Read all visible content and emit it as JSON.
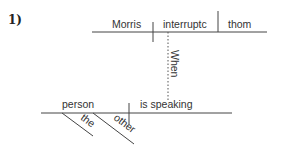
{
  "problem": {
    "number_label": "1)"
  },
  "diagram": {
    "main_clause": {
      "subject": "Morris",
      "verb": "interruptc",
      "object": "thom"
    },
    "connector": {
      "word": "When",
      "style": "dotted"
    },
    "subordinate_clause": {
      "subject": "person",
      "verb": "is speaking",
      "modifiers": [
        "the",
        "other"
      ]
    }
  },
  "colors": {
    "line": "#333333",
    "text": "#333333"
  }
}
